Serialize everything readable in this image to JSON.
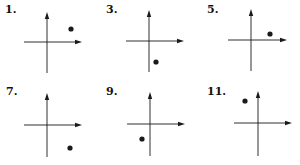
{
  "colors": {
    "ink": "#1a1a1a",
    "background": "#ffffff"
  },
  "panels": [
    {
      "label": "1.",
      "label_pos": [
        5,
        4
      ],
      "vaxis": {
        "x": 47,
        "y1": 12,
        "y2": 73
      },
      "haxis": {
        "y": 42,
        "x1": 24,
        "x2": 82
      },
      "point": {
        "x": 71,
        "y": 29,
        "quadrant": "I"
      }
    },
    {
      "label": "3.",
      "label_pos": [
        106,
        4
      ],
      "vaxis": {
        "x": 149,
        "y1": 10,
        "y2": 72
      },
      "haxis": {
        "y": 41,
        "x1": 126,
        "x2": 184
      },
      "point": {
        "x": 156,
        "y": 62,
        "quadrant": "IV"
      }
    },
    {
      "label": "5.",
      "label_pos": [
        207,
        4
      ],
      "vaxis": {
        "x": 251,
        "y1": 9,
        "y2": 71
      },
      "haxis": {
        "y": 40,
        "x1": 228,
        "x2": 287
      },
      "point": {
        "x": 270,
        "y": 34,
        "quadrant": "I"
      }
    },
    {
      "label": "7.",
      "label_pos": [
        6,
        86
      ],
      "vaxis": {
        "x": 47,
        "y1": 93,
        "y2": 157
      },
      "haxis": {
        "y": 125,
        "x1": 24,
        "x2": 82
      },
      "point": {
        "x": 70,
        "y": 148,
        "quadrant": "IV"
      }
    },
    {
      "label": "9.",
      "label_pos": [
        106,
        86
      ],
      "vaxis": {
        "x": 150,
        "y1": 92,
        "y2": 156
      },
      "haxis": {
        "y": 124,
        "x1": 127,
        "x2": 185
      },
      "point": {
        "x": 142,
        "y": 139,
        "quadrant": "III"
      }
    },
    {
      "label": "11.",
      "label_pos": [
        207,
        86
      ],
      "vaxis": {
        "x": 258,
        "y1": 91,
        "y2": 156
      },
      "haxis": {
        "y": 123,
        "x1": 234,
        "x2": 292
      },
      "point": {
        "x": 245,
        "y": 101,
        "quadrant": "II"
      }
    }
  ]
}
